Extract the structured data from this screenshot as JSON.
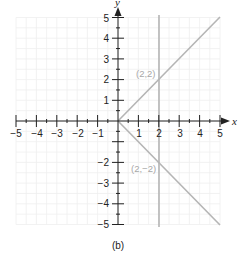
{
  "chart_data": {
    "type": "line",
    "title": "",
    "caption": "(b)",
    "xlabel": "x",
    "ylabel": "y",
    "xlim": [
      -5,
      5
    ],
    "ylim": [
      -5,
      5
    ],
    "grid": true,
    "x_ticks": [
      -5,
      -4,
      -3,
      -2,
      -1,
      1,
      2,
      3,
      4,
      5
    ],
    "y_ticks": [
      -5,
      -4,
      -3,
      -2,
      -1,
      1,
      2,
      3,
      4,
      5
    ],
    "x_tick_labels": [
      "−5",
      "−4",
      "−3",
      "−2",
      "−1",
      "1",
      "2",
      "3",
      "4",
      "5"
    ],
    "y_tick_labels": [
      "−5",
      "−4",
      "−3",
      "−2",
      "−1",
      "1",
      "2",
      "3",
      "4",
      "5"
    ],
    "series": [
      {
        "name": "y = x (x ≥ 0)",
        "x": [
          0,
          5
        ],
        "y": [
          0,
          5
        ],
        "color": "#b5b5b5"
      },
      {
        "name": "y = −x (x ≥ 0)",
        "x": [
          0,
          5
        ],
        "y": [
          0,
          -5
        ],
        "color": "#b5b5b5"
      },
      {
        "name": "x = 2",
        "x": [
          2,
          2
        ],
        "y": [
          -5,
          5
        ],
        "color": "#b5b5b5"
      }
    ],
    "annotations": [
      {
        "text": "(2,2)",
        "x": 2,
        "y": 2
      },
      {
        "text": "(2,−2)",
        "x": 2,
        "y": -2
      }
    ]
  },
  "labels": {
    "x_axis": "x",
    "y_axis": "y",
    "caption": "(b)",
    "point_upper": "(2,2)",
    "point_lower": "(2,−2)",
    "x_ticks": [
      "−5",
      "−4",
      "−3",
      "−2",
      "−1",
      "1",
      "2",
      "3",
      "4",
      "5"
    ],
    "y_ticks_pos": [
      "1",
      "2",
      "3",
      "4",
      "5"
    ],
    "y_ticks_neg": [
      "−1",
      "−2",
      "−3",
      "−4",
      "−5"
    ]
  },
  "colors": {
    "axis": "#222222",
    "line": "#b5b5b5",
    "grid": "#efefef",
    "label_muted": "#a8a8a8"
  }
}
